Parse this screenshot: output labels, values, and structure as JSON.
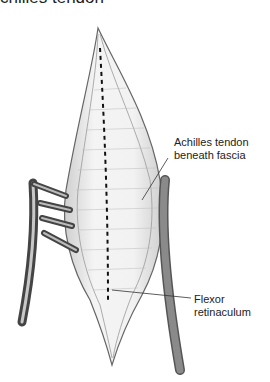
{
  "figure": {
    "title_fragment": "chilles tendon",
    "labels": [
      {
        "text_line1": "Achilles tendon",
        "text_line2": "beneath fascia"
      },
      {
        "text_line1": "Flexor",
        "text_line2": "retinaculum"
      }
    ],
    "colors": {
      "retractor": "#8a8a8a",
      "retractor_dark": "#555555",
      "tissue_line": "#777777",
      "incision_dash": "#111111"
    }
  }
}
